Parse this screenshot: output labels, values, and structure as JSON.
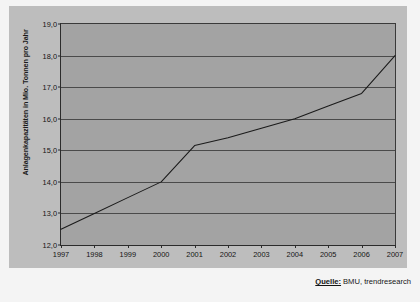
{
  "chart_data": {
    "type": "line",
    "title": "",
    "subtitle": "",
    "xlabel": "",
    "ylabel": "Anlagenkapazitäten in Mio. Tonnen pro Jahr",
    "categories": [
      "1997",
      "1998",
      "1999",
      "2000",
      "2001",
      "2002",
      "2003",
      "2004",
      "2005",
      "2006",
      "2007"
    ],
    "series": [
      {
        "name": "Anlagenkapazitäten",
        "values": [
          12.5,
          13.0,
          13.5,
          14.0,
          15.15,
          15.4,
          15.7,
          16.0,
          16.4,
          16.8,
          18.0
        ],
        "color": "#1a1a1a"
      }
    ],
    "ylim": [
      12.0,
      19.0
    ],
    "y_ticks": [
      "12,0",
      "13,0",
      "14,0",
      "15,0",
      "16,0",
      "17,0",
      "18,0",
      "19,0"
    ],
    "y_tick_values": [
      12,
      13,
      14,
      15,
      16,
      17,
      18,
      19
    ],
    "grid": "horizontal",
    "legend": "none",
    "plot_background": "#a3a3a3",
    "canvas_background": "#bdbdbd",
    "gridline_color": "#4a4a4a"
  },
  "source": {
    "label": "Quelle:",
    "value": "BMU, trendresearch"
  }
}
